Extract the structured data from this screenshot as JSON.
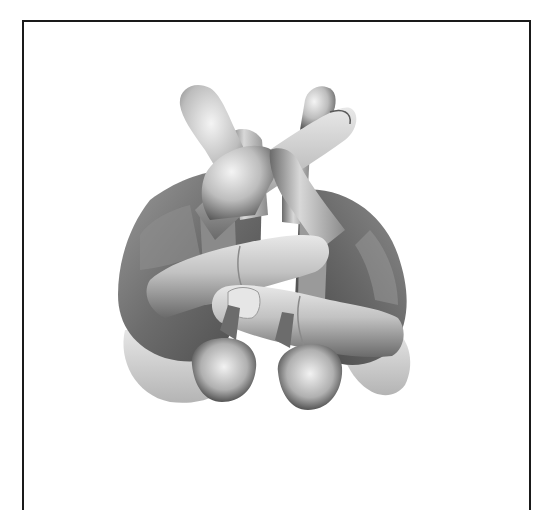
{
  "image": {
    "subject": "two clasped hands with interlaced fingers",
    "style": "grayscale 3D render",
    "frame": {
      "border_color": "#1a1a1a",
      "background": "#ffffff"
    },
    "palette": {
      "highlight": "#f2f2f2",
      "light": "#d0d0d0",
      "mid": "#a8a8a8",
      "shadow": "#6e6e6e",
      "dark": "#3c3c3c"
    }
  }
}
